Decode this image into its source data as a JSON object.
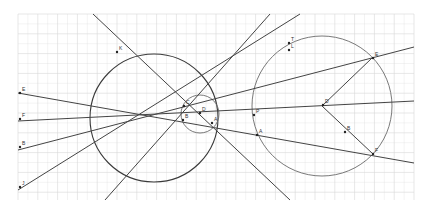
{
  "diagram": {
    "type": "geometric-construction",
    "background": "#ffffff",
    "grid": {
      "x_start": 18,
      "x_end": 414,
      "y_start": 14,
      "y_end": 200,
      "spacing": 19.8,
      "color": "#d6d6d6"
    },
    "circles": [
      {
        "id": "large-left",
        "cx": 154,
        "cy": 118,
        "r": 64,
        "color": "#3a3a3a"
      },
      {
        "id": "small-middle",
        "cx": 200,
        "cy": 114,
        "r": 19,
        "color": "#6a6a6a"
      },
      {
        "id": "right",
        "cx": 322,
        "cy": 106,
        "r": 70,
        "color": "#6a6a6a"
      }
    ],
    "lines": [
      {
        "id": "line-E",
        "x1": 18,
        "y1": 93,
        "x2": 414,
        "y2": 163
      },
      {
        "id": "line-F",
        "x1": 18,
        "y1": 121,
        "x2": 414,
        "y2": 101
      },
      {
        "id": "line-B",
        "x1": 18,
        "y1": 150,
        "x2": 414,
        "y2": 47
      },
      {
        "id": "line-J",
        "x1": 18,
        "y1": 190,
        "x2": 300,
        "y2": 14
      },
      {
        "id": "line-K",
        "x1": 93,
        "y1": 14,
        "x2": 290,
        "y2": 200
      },
      {
        "id": "line-steep",
        "x1": 105,
        "y1": 200,
        "x2": 270,
        "y2": 14
      },
      {
        "id": "radius-1",
        "x1": 322,
        "y1": 106,
        "x2": 372,
        "y2": 58
      },
      {
        "id": "radius-2",
        "x1": 322,
        "y1": 106,
        "x2": 373,
        "y2": 154
      }
    ],
    "points": [
      {
        "label": "E",
        "x": 20,
        "y": 93
      },
      {
        "label": "F",
        "x": 20,
        "y": 119
      },
      {
        "label": "B",
        "x": 20,
        "y": 147
      },
      {
        "label": "J",
        "x": 20,
        "y": 187
      },
      {
        "label": "K",
        "x": 117,
        "y": 52
      },
      {
        "label": "T",
        "x": 289,
        "y": 43
      },
      {
        "label": "L",
        "x": 289,
        "y": 50
      },
      {
        "label": "E",
        "x": 373,
        "y": 58
      },
      {
        "label": "D",
        "x": 323,
        "y": 105
      },
      {
        "label": "A",
        "x": 257,
        "y": 135
      },
      {
        "label": "B",
        "x": 345,
        "y": 132
      },
      {
        "label": "F",
        "x": 373,
        "y": 154
      },
      {
        "label": "P",
        "x": 254,
        "y": 115
      },
      {
        "label": "D",
        "x": 200,
        "y": 113
      },
      {
        "label": "C",
        "x": 184,
        "y": 106
      },
      {
        "label": "B",
        "x": 183,
        "y": 120
      },
      {
        "label": "A",
        "x": 212,
        "y": 123
      }
    ]
  }
}
